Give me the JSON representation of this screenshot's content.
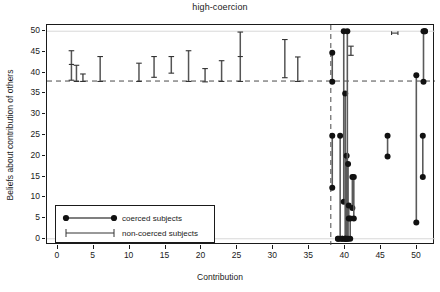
{
  "chart_data": {
    "type": "scatter",
    "title": "high-coercion",
    "xlabel": "Contribution",
    "ylabel": "Beliefs about contribution of others",
    "xlim": [
      -1.5,
      52.5
    ],
    "ylim": [
      -1.5,
      51.5
    ],
    "xticks": [
      0,
      5,
      10,
      15,
      20,
      25,
      30,
      35,
      40,
      45,
      50
    ],
    "yticks": [
      0,
      5,
      10,
      15,
      20,
      25,
      30,
      35,
      40,
      45,
      50
    ],
    "grid": false,
    "legend_position": "lower-left",
    "reference_lines": [
      {
        "orientation": "horizontal",
        "value": 38,
        "style": "dashed"
      },
      {
        "orientation": "vertical",
        "value": 38,
        "style": "dashed"
      }
    ],
    "series": [
      {
        "name": "coerced subjects",
        "marker": "filled-circle",
        "style": "line-with-round-endpoints",
        "segments": [
          {
            "x": 38.2,
            "low": 12.3,
            "high": 24.8
          },
          {
            "x": 38.2,
            "low": 37.8,
            "high": 44.8
          },
          {
            "x": 39.0,
            "low": 0.0,
            "high": 0.0
          },
          {
            "x": 39.3,
            "low": 0.0,
            "high": 24.8
          },
          {
            "x": 39.6,
            "low": 0.0,
            "high": 0.0
          },
          {
            "x": 39.8,
            "low": 8.9,
            "high": 50.0
          },
          {
            "x": 40.0,
            "low": 0.0,
            "high": 35.0
          },
          {
            "x": 40.0,
            "low": 0.0,
            "high": 0.0
          },
          {
            "x": 40.2,
            "low": 0.0,
            "high": 20.0
          },
          {
            "x": 40.3,
            "low": 0.0,
            "high": 50.0
          },
          {
            "x": 40.4,
            "low": 0.0,
            "high": 18.0
          },
          {
            "x": 40.5,
            "low": 4.9,
            "high": 8.0
          },
          {
            "x": 40.7,
            "low": 0.0,
            "high": 4.9
          },
          {
            "x": 41.0,
            "low": 7.4,
            "high": 14.9
          },
          {
            "x": 41.2,
            "low": 4.9,
            "high": 14.9
          },
          {
            "x": 45.9,
            "low": 19.8,
            "high": 24.8
          },
          {
            "x": 49.9,
            "low": 3.9,
            "high": 39.4
          },
          {
            "x": 50.8,
            "low": 14.9,
            "high": 24.8
          },
          {
            "x": 50.9,
            "low": 37.8,
            "high": 50.0
          },
          {
            "x": 51.1,
            "low": 50.0,
            "high": 50.0
          }
        ]
      },
      {
        "name": "non-coerced subjects",
        "marker": "capped-error-bar",
        "style": "vertical-bar-with-caps",
        "segments": [
          {
            "x": 1.9,
            "low": 38.2,
            "high": 45.3,
            "mid": 42.0
          },
          {
            "x": 2.6,
            "low": 37.9,
            "high": 41.8
          },
          {
            "x": 3.5,
            "low": 37.9,
            "high": 39.7
          },
          {
            "x": 5.9,
            "low": 37.9,
            "high": 43.9
          },
          {
            "x": 11.3,
            "low": 37.9,
            "high": 42.3
          },
          {
            "x": 13.4,
            "low": 38.9,
            "high": 43.9
          },
          {
            "x": 15.8,
            "low": 39.9,
            "high": 43.9
          },
          {
            "x": 18.2,
            "low": 37.9,
            "high": 45.3
          },
          {
            "x": 20.5,
            "low": 37.8,
            "high": 41.0
          },
          {
            "x": 22.8,
            "low": 37.9,
            "high": 42.9
          },
          {
            "x": 25.4,
            "low": 37.9,
            "high": 49.8,
            "mid": 43.9
          },
          {
            "x": 31.6,
            "low": 38.8,
            "high": 48.0
          },
          {
            "x": 33.4,
            "low": 37.9,
            "high": 43.8
          },
          {
            "x": 40.8,
            "low": 44.2,
            "high": 46.4
          },
          {
            "x": 46.9,
            "low": 49.3,
            "high": 49.8,
            "horizontal": true
          }
        ]
      }
    ]
  },
  "legend": {
    "entries": [
      {
        "label": "coerced subjects",
        "marker": "filled-circle-line"
      },
      {
        "label": "non-coerced subjects",
        "marker": "capped-line"
      }
    ]
  }
}
